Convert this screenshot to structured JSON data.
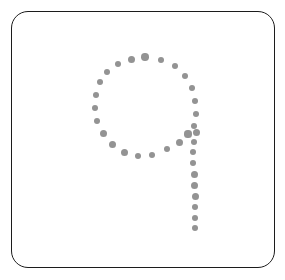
{
  "canvas": {
    "width": 285,
    "height": 280,
    "background_color": "#ffffff"
  },
  "frame": {
    "shape": "rounded-rectangle",
    "x": 11,
    "y": 11,
    "width": 264,
    "height": 257,
    "corner_radius": 17,
    "stroke_color": "#1c1c1c",
    "stroke_width": 1.6,
    "fill_color": "#ffffff"
  },
  "glyph": {
    "character": "9",
    "description": "dotted outline of the digit nine",
    "style": "stippled",
    "dot_color": "#8a8a8a",
    "dot_diameter": 7,
    "dot_count": 37,
    "loop": {
      "center_x": 144,
      "center_y": 110,
      "radius_x": 52,
      "radius_y": 55
    },
    "tail": {
      "start_x": 190,
      "start_y": 134,
      "end_x": 195,
      "end_y": 228
    }
  },
  "chart_data": {
    "type": "scatter",
    "title": "",
    "xlabel": "",
    "ylabel": "",
    "xlim": [
      0,
      285
    ],
    "ylim": [
      0,
      280
    ],
    "grid": false,
    "legend": null,
    "series": [
      {
        "name": "glyph-9-stipple",
        "color": "#8a8a8a",
        "marker": "circle",
        "marker_size": 7,
        "points": [
          {
            "x": 145,
            "y": 57,
            "r": 3.7
          },
          {
            "x": 131,
            "y": 59,
            "r": 3.5
          },
          {
            "x": 161,
            "y": 60,
            "r": 3.4
          },
          {
            "x": 118,
            "y": 64,
            "r": 3.4
          },
          {
            "x": 175,
            "y": 66,
            "r": 3.4
          },
          {
            "x": 107,
            "y": 72,
            "r": 3.4
          },
          {
            "x": 185,
            "y": 76,
            "r": 3.3
          },
          {
            "x": 100,
            "y": 82,
            "r": 3.3
          },
          {
            "x": 192,
            "y": 88,
            "r": 3.4
          },
          {
            "x": 96,
            "y": 95,
            "r": 3.4
          },
          {
            "x": 195,
            "y": 101,
            "r": 3.4
          },
          {
            "x": 95,
            "y": 108,
            "r": 3.4
          },
          {
            "x": 196,
            "y": 114,
            "r": 3.4
          },
          {
            "x": 97,
            "y": 121,
            "r": 3.4
          },
          {
            "x": 194,
            "y": 126,
            "r": 3.4
          },
          {
            "x": 103,
            "y": 133,
            "r": 3.5
          },
          {
            "x": 188,
            "y": 134,
            "r": 3.6
          },
          {
            "x": 196,
            "y": 132,
            "r": 3.5
          },
          {
            "x": 112,
            "y": 144,
            "r": 3.5
          },
          {
            "x": 179,
            "y": 142,
            "r": 3.5
          },
          {
            "x": 124,
            "y": 152,
            "r": 3.5
          },
          {
            "x": 167,
            "y": 149,
            "r": 3.4
          },
          {
            "x": 138,
            "y": 156,
            "r": 3.4
          },
          {
            "x": 152,
            "y": 155,
            "r": 3.2
          },
          {
            "x": 194,
            "y": 142,
            "r": 3.3
          },
          {
            "x": 193,
            "y": 152,
            "r": 3.4
          },
          {
            "x": 193,
            "y": 163,
            "r": 3.4
          },
          {
            "x": 194,
            "y": 174,
            "r": 3.5
          },
          {
            "x": 194,
            "y": 185,
            "r": 3.5
          },
          {
            "x": 195,
            "y": 196,
            "r": 3.5
          },
          {
            "x": 195,
            "y": 207,
            "r": 3.4
          },
          {
            "x": 195,
            "y": 218,
            "r": 3.4
          },
          {
            "x": 195,
            "y": 228,
            "r": 3.4
          }
        ]
      }
    ]
  }
}
